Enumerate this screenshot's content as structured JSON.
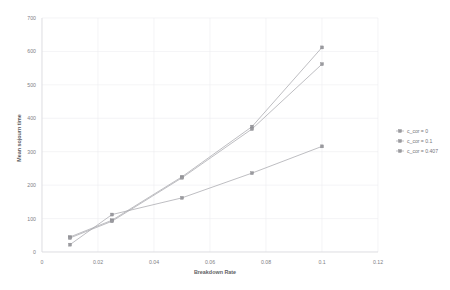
{
  "chart_data": {
    "type": "line",
    "title": "",
    "xlabel": "Breakdown Rate",
    "ylabel": "Mean sojourn time",
    "x": [
      0.01,
      0.025,
      0.05,
      0.075,
      0.1
    ],
    "xlim": [
      0,
      0.12
    ],
    "ylim": [
      0,
      700
    ],
    "xticks": [
      "0",
      "0.02",
      "0.04",
      "0.06",
      "0.08",
      "0.1",
      "0.12"
    ],
    "xtick_values": [
      0,
      0.02,
      0.04,
      0.06,
      0.08,
      0.1,
      0.12
    ],
    "yticks": [
      "0",
      "100",
      "200",
      "300",
      "400",
      "500",
      "600",
      "700"
    ],
    "ytick_values": [
      0,
      100,
      200,
      300,
      400,
      500,
      600,
      700
    ],
    "grid": true,
    "legend_position": "right",
    "series": [
      {
        "name": "c_cor = 0",
        "values": [
          45,
          95,
          225,
          375,
          612
        ],
        "color": "#a8a8ad"
      },
      {
        "name": "c_cor = 0.1",
        "values": [
          42,
          92,
          222,
          368,
          562
        ],
        "color": "#a8a8ad"
      },
      {
        "name": "c_cor = 0.407",
        "values": [
          22,
          112,
          162,
          236,
          316
        ],
        "color": "#a8a8ad"
      }
    ]
  },
  "legend": {
    "entries": [
      {
        "label": "c_cor = 0"
      },
      {
        "label": "c_cor = 0.1"
      },
      {
        "label": "c_cor = 0.407"
      }
    ]
  },
  "colors": {
    "background": "#ffffff",
    "grid": "#ededf0",
    "axis": "#d9d9dd",
    "series": "#a8a8ad",
    "tick_text": "#808085",
    "title_text": "#5f5f64"
  }
}
